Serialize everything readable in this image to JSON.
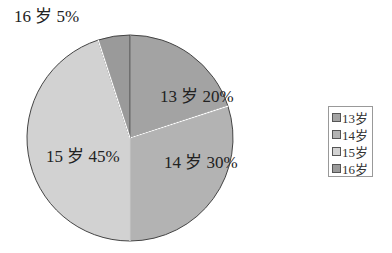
{
  "chart_data": {
    "type": "pie",
    "title": "",
    "categories": [
      "13岁",
      "14岁",
      "15岁",
      "16岁"
    ],
    "values": [
      20,
      30,
      45,
      5
    ],
    "unit": "%",
    "colors": [
      "#a3a3a3",
      "#b3b3b3",
      "#d2d2d2",
      "#9a9a9a"
    ],
    "data_labels": [
      "13 岁 20%",
      "14 岁 30%",
      "15 岁 45%",
      "16 岁 5%"
    ],
    "legend_position": "right",
    "start_angle": "12 o'clock",
    "direction": "clockwise"
  },
  "legend": {
    "items": [
      {
        "label": "13岁",
        "color": "#a3a3a3"
      },
      {
        "label": "14岁",
        "color": "#b3b3b3"
      },
      {
        "label": "15岁",
        "color": "#d2d2d2"
      },
      {
        "label": "16岁",
        "color": "#9a9a9a"
      }
    ]
  }
}
